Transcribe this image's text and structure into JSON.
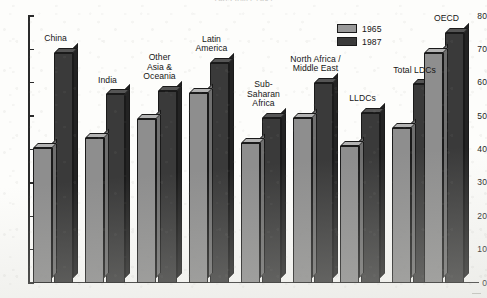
{
  "chart_data": {
    "type": "bar",
    "title": "1965 AND 1987",
    "subtitle": "",
    "xlabel": "",
    "ylabel": "",
    "ylim": [
      0,
      80
    ],
    "yticks": [
      0,
      10,
      20,
      30,
      40,
      50,
      60,
      70,
      80
    ],
    "ytick_labels": [
      "0",
      "10",
      "20",
      "30",
      "40",
      "50",
      "60",
      "70",
      "80"
    ],
    "grid": false,
    "legend_position": "top-right",
    "categories": [
      "China",
      "India",
      "Other\nAsia &\nOceania",
      "Latin\nAmerica",
      "Sub-\nSaharan\nAfrica",
      "North Africa /\nMiddle East",
      "LLDCs",
      "Total LDCs",
      "OECD"
    ],
    "series": [
      {
        "name": "1965",
        "color": "#8e8e8e",
        "values": [
          40.5,
          43.5,
          49.0,
          57.0,
          42.0,
          49.5,
          41.0,
          46.5,
          69.0
        ]
      },
      {
        "name": "1987",
        "color": "#3a3a3a",
        "values": [
          69.0,
          56.5,
          57.5,
          66.0,
          49.5,
          60.0,
          51.0,
          59.5,
          75.0
        ]
      }
    ],
    "group_separator_after_index": 5
  },
  "legend": {
    "items": [
      {
        "label": "1965",
        "swatch": "light-gray"
      },
      {
        "label": "1987",
        "swatch": "dark-gray"
      }
    ]
  },
  "colors": {
    "series_1965": "#8e8e8e",
    "series_1987": "#3a3a3a",
    "axis": "#2b2b2b",
    "text": "#151515",
    "paper": "#fdfdfb"
  }
}
